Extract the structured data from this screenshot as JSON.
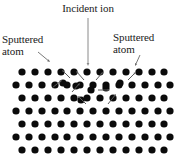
{
  "figure": {
    "background_color": "#ffffff",
    "width": 176,
    "height": 161
  },
  "labels": {
    "incident_ion": "Incident ion",
    "sputtered_atom_left": "Sputtered\natom",
    "sputtered_atom_right": "Sputtered\natom"
  },
  "colors": {
    "atom": "#0b0b0b",
    "cascade_arrow": "#5a5a5a",
    "pointer_arrow": "#6a6a6a",
    "ion_arrow": "#8a8a8a",
    "text": "#1a1a1a"
  },
  "chart_data": {
    "type": "scatter",
    "xlabel": "",
    "ylabel": "",
    "xlim": [
      0,
      176
    ],
    "ylim": [
      0,
      161
    ],
    "grid": false,
    "legend": "none",
    "annotations": [
      "Incident ion",
      "Sputtered atom",
      "Sputtered atom"
    ],
    "atom_radius": 3.6,
    "lattice_rows": [
      {
        "row": 0,
        "y": 72,
        "x": [
          22,
          35,
          48,
          61,
          74,
          87,
          100,
          113,
          126,
          139,
          152,
          164
        ]
      },
      {
        "row": 1,
        "y": 85,
        "x": [
          16,
          29,
          42,
          55,
          67,
          80,
          93,
          106,
          119,
          132,
          145,
          158,
          170
        ]
      },
      {
        "row": 2,
        "y": 98,
        "x": [
          22,
          35,
          48,
          61,
          74,
          87,
          100,
          113,
          126,
          139,
          152,
          164
        ]
      },
      {
        "row": 3,
        "y": 111,
        "x": [
          16,
          29,
          42,
          55,
          67,
          80,
          93,
          106,
          119,
          132,
          145,
          158,
          170
        ]
      },
      {
        "row": 4,
        "y": 124,
        "x": [
          22,
          35,
          48,
          61,
          74,
          87,
          100,
          113,
          126,
          139,
          152,
          164
        ]
      },
      {
        "row": 5,
        "y": 137,
        "x": [
          16,
          29,
          42,
          55,
          67,
          80,
          93,
          106,
          119,
          132,
          145,
          158,
          170
        ]
      },
      {
        "row": 6,
        "y": 150,
        "x": [
          22,
          35,
          48,
          61,
          74,
          87,
          100,
          113,
          126,
          139,
          152,
          164
        ]
      }
    ],
    "displaced_atoms": [
      {
        "x": 63,
        "y": 83
      },
      {
        "x": 76,
        "y": 86
      },
      {
        "x": 91,
        "y": 90
      },
      {
        "x": 106,
        "y": 88
      },
      {
        "x": 81,
        "y": 100
      },
      {
        "x": 120,
        "y": 83
      }
    ],
    "cascade_arrows": [
      {
        "x1": 52,
        "y1": 88,
        "x2": 62,
        "y2": 80,
        "note": "upward-left recoil"
      },
      {
        "x1": 70,
        "y1": 78,
        "x2": 62,
        "y2": 70,
        "note": "toward surface left"
      },
      {
        "x1": 84,
        "y1": 80,
        "x2": 76,
        "y2": 71,
        "note": "toward surface"
      },
      {
        "x1": 96,
        "y1": 80,
        "x2": 103,
        "y2": 72,
        "note": "toward surface right"
      },
      {
        "x1": 98,
        "y1": 90,
        "x2": 110,
        "y2": 90,
        "note": "lateral recoil"
      },
      {
        "x1": 72,
        "y1": 92,
        "x2": 80,
        "y2": 83,
        "note": "inner cascade"
      },
      {
        "x1": 86,
        "y1": 104,
        "x2": 78,
        "y2": 96,
        "note": "deep cascade up"
      },
      {
        "x1": 108,
        "y1": 104,
        "x2": 116,
        "y2": 94,
        "note": "deep cascade right"
      },
      {
        "x1": 128,
        "y1": 80,
        "x2": 136,
        "y2": 72,
        "note": "right escape"
      }
    ],
    "incident_ion_arrow": {
      "x1": 88,
      "y1": 18,
      "x2": 88,
      "y2": 66,
      "direction": "down"
    },
    "pointer_arrows": [
      {
        "name": "sputtered-left-pointer",
        "x1": 38,
        "y1": 52,
        "x2": 50,
        "y2": 62
      },
      {
        "name": "sputtered-right-pointer",
        "x1": 140,
        "y1": 55,
        "x2": 135,
        "y2": 66
      }
    ]
  }
}
